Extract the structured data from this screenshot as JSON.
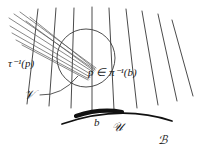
{
  "figure": {
    "type": "fiber-bundle-diagram",
    "background_color": "#ffffff",
    "ink_color": "#1a1a1a",
    "labels": {
      "tau_preimage": "τ⁻¹(p)",
      "point_in_fiber": "p ∈ π⁻¹(b)",
      "neighborhood_V": "𝒱",
      "base_point": "b",
      "neighborhood_U": "𝒰",
      "base_space": "ℬ"
    },
    "elements": {
      "fibers_label": "fiber lines",
      "base_curve_label": "base manifold arc",
      "highlighted_arc_label": "highlighted neighborhood arc",
      "circle_label": "neighborhood circle",
      "cone_label": "hatched cone of lines",
      "leader_label": "leader line"
    }
  },
  "geometry": {
    "fibers": [
      {
        "x1": 38,
        "y1": 9,
        "x2": 27,
        "y2": 104
      },
      {
        "x1": 56,
        "y1": 8,
        "x2": 49,
        "y2": 106
      },
      {
        "x1": 74,
        "y1": 8,
        "x2": 71,
        "y2": 108
      },
      {
        "x1": 92,
        "y1": 7,
        "x2": 92,
        "y2": 110
      },
      {
        "x1": 109,
        "y1": 8,
        "x2": 114,
        "y2": 110
      },
      {
        "x1": 126,
        "y1": 9,
        "x2": 137,
        "y2": 108
      },
      {
        "x1": 142,
        "y1": 11,
        "x2": 158,
        "y2": 105
      },
      {
        "x1": 158,
        "y1": 14,
        "x2": 177,
        "y2": 101
      },
      {
        "x1": 172,
        "y1": 20,
        "x2": 193,
        "y2": 96
      }
    ],
    "cone_lines": [
      {
        "x1": 9,
        "y1": 18,
        "x2": 93,
        "y2": 72
      },
      {
        "x1": 14,
        "y1": 14,
        "x2": 95,
        "y2": 70
      },
      {
        "x1": 20,
        "y1": 12,
        "x2": 96,
        "y2": 68
      },
      {
        "x1": 10,
        "y1": 26,
        "x2": 92,
        "y2": 75
      },
      {
        "x1": 12,
        "y1": 33,
        "x2": 90,
        "y2": 77
      },
      {
        "x1": 16,
        "y1": 40,
        "x2": 89,
        "y2": 79
      },
      {
        "x1": 22,
        "y1": 45,
        "x2": 88,
        "y2": 80
      },
      {
        "x1": 26,
        "y1": 21,
        "x2": 94,
        "y2": 71
      },
      {
        "x1": 30,
        "y1": 17,
        "x2": 95,
        "y2": 69
      }
    ],
    "circle": {
      "cx": 86,
      "cy": 58,
      "rx": 29,
      "ry": 29
    },
    "base_curve": "M 62 124 Q 120 104 172 121",
    "highlight_arc": "M 76 116 Q 100 108 122 112",
    "leader": "M 40 95 Q 62 96 78 76"
  }
}
